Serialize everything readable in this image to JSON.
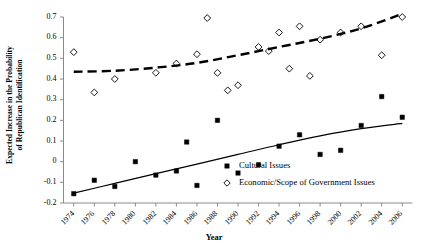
{
  "chart_data": {
    "type": "scatter",
    "title": "",
    "xlabel": "Year",
    "ylabel": "Expected Increase in the Probability of Republican Identification",
    "ylabel_line1": "Expected Increase in the Probability",
    "ylabel_line2": "of Republican Identification",
    "xlim": [
      1973,
      2007
    ],
    "ylim": [
      -0.2,
      0.7
    ],
    "xticks": [
      1974,
      1976,
      1978,
      1980,
      1982,
      1984,
      1986,
      1988,
      1990,
      1992,
      1994,
      1996,
      1998,
      2000,
      2002,
      2004,
      2006
    ],
    "xticklabels": [
      "1974",
      "1976",
      "1978",
      "1980",
      "1982",
      "1984",
      "1986",
      "1988",
      "1990",
      "1992",
      "1994",
      "1996",
      "1998",
      "2000",
      "2002",
      "2004",
      "2006"
    ],
    "yticks": [
      -0.2,
      -0.1,
      0,
      0.1,
      0.2,
      0.3,
      0.4,
      0.5,
      0.6,
      0.7
    ],
    "yticklabels": [
      "-0.2",
      "-0.1",
      "0",
      "0.1",
      "0.2",
      "0.3",
      "0.4",
      "0.5",
      "0.6",
      "0.7"
    ],
    "grid": false,
    "legend_position": "inside-lower-right",
    "series": [
      {
        "name": "Cultural Issues",
        "marker": "filled-square",
        "color": "#000000",
        "trendline": "solid",
        "points": [
          {
            "x": 1974,
            "y": -0.155
          },
          {
            "x": 1976,
            "y": -0.09
          },
          {
            "x": 1978,
            "y": -0.12
          },
          {
            "x": 1980,
            "y": 0.0
          },
          {
            "x": 1982,
            "y": -0.065
          },
          {
            "x": 1984,
            "y": -0.045
          },
          {
            "x": 1985,
            "y": 0.095
          },
          {
            "x": 1986,
            "y": -0.115
          },
          {
            "x": 1988,
            "y": 0.2
          },
          {
            "x": 1990,
            "y": -0.055
          },
          {
            "x": 1992,
            "y": -0.015
          },
          {
            "x": 1994,
            "y": 0.075
          },
          {
            "x": 1996,
            "y": 0.13
          },
          {
            "x": 1998,
            "y": 0.035
          },
          {
            "x": 2000,
            "y": 0.055
          },
          {
            "x": 2002,
            "y": 0.175
          },
          {
            "x": 2004,
            "y": 0.315
          },
          {
            "x": 2006,
            "y": 0.215
          }
        ],
        "trend_points": [
          {
            "x": 1974,
            "y": -0.152
          },
          {
            "x": 1978,
            "y": -0.105
          },
          {
            "x": 1982,
            "y": -0.058
          },
          {
            "x": 1986,
            "y": -0.012
          },
          {
            "x": 1990,
            "y": 0.035
          },
          {
            "x": 1994,
            "y": 0.082
          },
          {
            "x": 1998,
            "y": 0.125
          },
          {
            "x": 2002,
            "y": 0.16
          },
          {
            "x": 2006,
            "y": 0.185
          }
        ]
      },
      {
        "name": "Economic/Scope of Government Issues",
        "marker": "open-diamond",
        "color": "#000000",
        "trendline": "dashed",
        "points": [
          {
            "x": 1974,
            "y": 0.53
          },
          {
            "x": 1976,
            "y": 0.335
          },
          {
            "x": 1978,
            "y": 0.4
          },
          {
            "x": 1982,
            "y": 0.43
          },
          {
            "x": 1984,
            "y": 0.475
          },
          {
            "x": 1986,
            "y": 0.52
          },
          {
            "x": 1987,
            "y": 0.695
          },
          {
            "x": 1988,
            "y": 0.43
          },
          {
            "x": 1989,
            "y": 0.345
          },
          {
            "x": 1990,
            "y": 0.37
          },
          {
            "x": 1992,
            "y": 0.555
          },
          {
            "x": 1993,
            "y": 0.535
          },
          {
            "x": 1994,
            "y": 0.625
          },
          {
            "x": 1995,
            "y": 0.45
          },
          {
            "x": 1996,
            "y": 0.655
          },
          {
            "x": 1997,
            "y": 0.415
          },
          {
            "x": 1998,
            "y": 0.59
          },
          {
            "x": 2000,
            "y": 0.625
          },
          {
            "x": 2002,
            "y": 0.655
          },
          {
            "x": 2004,
            "y": 0.515
          },
          {
            "x": 2006,
            "y": 0.7
          }
        ],
        "trend_points": [
          {
            "x": 1974,
            "y": 0.435
          },
          {
            "x": 1978,
            "y": 0.44
          },
          {
            "x": 1982,
            "y": 0.455
          },
          {
            "x": 1986,
            "y": 0.478
          },
          {
            "x": 1990,
            "y": 0.515
          },
          {
            "x": 1994,
            "y": 0.555
          },
          {
            "x": 1998,
            "y": 0.595
          },
          {
            "x": 2002,
            "y": 0.645
          },
          {
            "x": 2006,
            "y": 0.715
          }
        ]
      }
    ],
    "legend": [
      {
        "label": "Cultural Issues",
        "marker": "filled-square"
      },
      {
        "label": "Economic/Scope of Government Issues",
        "marker": "open-diamond"
      }
    ]
  }
}
